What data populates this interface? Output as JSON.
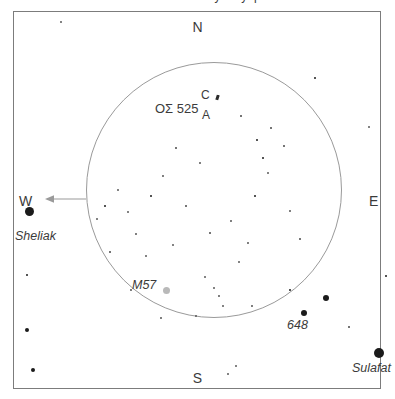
{
  "caption": {
    "text": "Observation sketch — Lyra eyepiece field"
  },
  "chart_data": {
    "type": "scatter",
    "subtitle": "",
    "xlabel": "",
    "ylabel": "",
    "grid": false,
    "legend_position": "none",
    "axis_note": "Sky chart: cardinal directions mark field orientation, not numeric axes",
    "field_of_view_circle": {
      "center_x_px": 214,
      "center_y_px": 190,
      "radius_px": 128,
      "stroke": "#9a9a9a"
    },
    "cardinals": [
      {
        "label": "N",
        "position": "top"
      },
      {
        "label": "S",
        "position": "bottom"
      },
      {
        "label": "E",
        "position": "right"
      },
      {
        "label": "W",
        "position": "left"
      }
    ],
    "drift_arrow": {
      "direction": "west",
      "from_x_px": 86,
      "to_x_px": 48,
      "y_px": 199
    },
    "annotations": [
      {
        "text": "OΣ 525",
        "x": 155,
        "y": 101,
        "kind": "double-star-designation"
      },
      {
        "text": "C",
        "x": 201,
        "y": 88,
        "kind": "component-label"
      },
      {
        "text": "A",
        "x": 202,
        "y": 108,
        "kind": "component-label"
      },
      {
        "text": "M57",
        "x": 132,
        "y": 278,
        "kind": "deep-sky-object"
      },
      {
        "text": "648",
        "x": 287,
        "y": 318,
        "kind": "star-number"
      },
      {
        "text": "Sheliak",
        "x": 15,
        "y": 229,
        "kind": "star-name"
      },
      {
        "text": "Sulafat",
        "x": 352,
        "y": 361,
        "kind": "star-name"
      }
    ],
    "objects": [
      {
        "name": "Sheliak",
        "type": "star",
        "x": 29,
        "y": 211,
        "size": 9,
        "color": "#1b1b1b"
      },
      {
        "name": "Sulafat",
        "type": "star",
        "x": 379,
        "y": 353,
        "size": 10,
        "color": "#1b1b1b"
      },
      {
        "name": "648",
        "type": "star",
        "x": 304,
        "y": 313,
        "size": 6,
        "color": "#1b1b1b"
      },
      {
        "name": "M57",
        "type": "nebula",
        "x": 166,
        "y": 290,
        "size": 7,
        "color": "#b9b9b9"
      }
    ],
    "stars": [
      {
        "x": 29,
        "y": 211,
        "r": 4.5
      },
      {
        "x": 379,
        "y": 353,
        "r": 5.0
      },
      {
        "x": 304,
        "y": 313,
        "r": 3.0
      },
      {
        "x": 326,
        "y": 298,
        "r": 3.0
      },
      {
        "x": 290,
        "y": 290,
        "r": 1.2
      },
      {
        "x": 349,
        "y": 327,
        "r": 0.8
      },
      {
        "x": 33,
        "y": 370,
        "r": 2.2
      },
      {
        "x": 27,
        "y": 330,
        "r": 2.0
      },
      {
        "x": 27,
        "y": 275,
        "r": 1.4
      },
      {
        "x": 61,
        "y": 22,
        "r": 1.1
      },
      {
        "x": 315,
        "y": 78,
        "r": 1.3
      },
      {
        "x": 369,
        "y": 127,
        "r": 1.0
      },
      {
        "x": 386,
        "y": 276,
        "r": 1.2
      },
      {
        "x": 228,
        "y": 374,
        "r": 1.0
      },
      {
        "x": 236,
        "y": 366,
        "r": 1.1
      },
      {
        "x": 257,
        "y": 140,
        "r": 1.3
      },
      {
        "x": 263,
        "y": 158,
        "r": 1.3
      },
      {
        "x": 268,
        "y": 173,
        "r": 1.0
      },
      {
        "x": 255,
        "y": 196,
        "r": 1.2
      },
      {
        "x": 284,
        "y": 146,
        "r": 0.8
      },
      {
        "x": 271,
        "y": 128,
        "r": 0.8
      },
      {
        "x": 151,
        "y": 196,
        "r": 1.2
      },
      {
        "x": 118,
        "y": 190,
        "r": 1.1
      },
      {
        "x": 128,
        "y": 212,
        "r": 1.0
      },
      {
        "x": 105,
        "y": 206,
        "r": 1.2
      },
      {
        "x": 97,
        "y": 219,
        "r": 1.0
      },
      {
        "x": 136,
        "y": 234,
        "r": 0.9
      },
      {
        "x": 146,
        "y": 256,
        "r": 1.0
      },
      {
        "x": 173,
        "y": 245,
        "r": 1.0
      },
      {
        "x": 205,
        "y": 277,
        "r": 1.1
      },
      {
        "x": 214,
        "y": 288,
        "r": 1.0
      },
      {
        "x": 219,
        "y": 296,
        "r": 0.9
      },
      {
        "x": 223,
        "y": 306,
        "r": 1.1
      },
      {
        "x": 196,
        "y": 316,
        "r": 0.9
      },
      {
        "x": 239,
        "y": 262,
        "r": 1.0
      },
      {
        "x": 248,
        "y": 243,
        "r": 0.9
      },
      {
        "x": 231,
        "y": 221,
        "r": 0.9
      },
      {
        "x": 200,
        "y": 163,
        "r": 0.9
      },
      {
        "x": 176,
        "y": 148,
        "r": 0.8
      },
      {
        "x": 163,
        "y": 176,
        "r": 0.9
      },
      {
        "x": 186,
        "y": 206,
        "r": 0.8
      },
      {
        "x": 210,
        "y": 233,
        "r": 0.8
      },
      {
        "x": 252,
        "y": 306,
        "r": 0.9
      },
      {
        "x": 161,
        "y": 318,
        "r": 0.9
      },
      {
        "x": 131,
        "y": 290,
        "r": 0.9
      },
      {
        "x": 110,
        "y": 252,
        "r": 0.8
      },
      {
        "x": 241,
        "y": 116,
        "r": 0.8
      },
      {
        "x": 218,
        "y": 96,
        "r": 1.4
      },
      {
        "x": 290,
        "y": 211,
        "r": 0.9
      },
      {
        "x": 300,
        "y": 239,
        "r": 0.8
      }
    ]
  }
}
